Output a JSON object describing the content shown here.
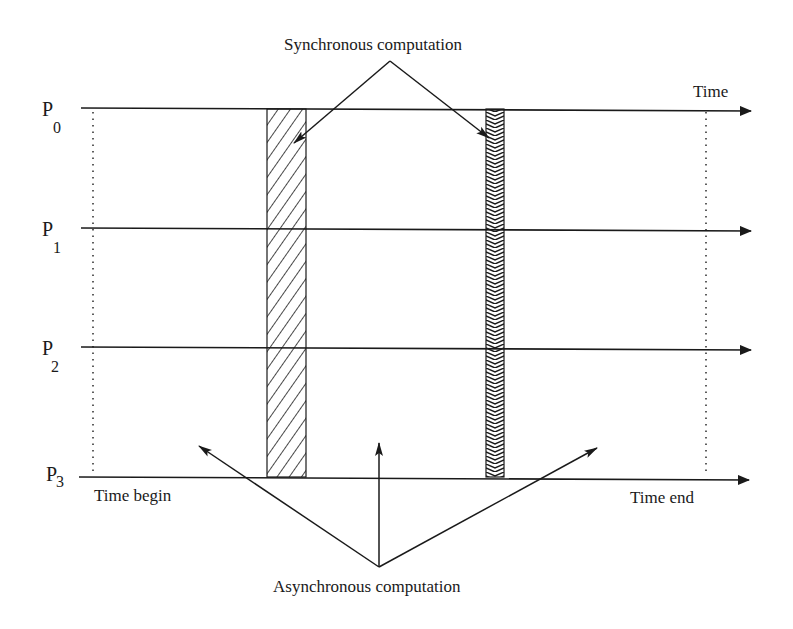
{
  "figure": {
    "top_label": "Synchronous computation",
    "bottom_label": "Asynchronous computation",
    "time_axis_label": "Time",
    "time_begin_label": "Time begin",
    "time_end_label": "Time end",
    "processors": [
      {
        "letter": "P",
        "index": "0"
      },
      {
        "letter": "P",
        "index": "1"
      },
      {
        "letter": "P",
        "index": "2"
      },
      {
        "letter": "P",
        "index": "3"
      }
    ],
    "sync_blocks": [
      {
        "name": "sync-block-1",
        "pattern": "diagonal-hatch"
      },
      {
        "name": "sync-block-2",
        "pattern": "zigzag-hatch"
      }
    ],
    "colors": {
      "ink": "#1a1a1a",
      "background": "#ffffff"
    }
  }
}
